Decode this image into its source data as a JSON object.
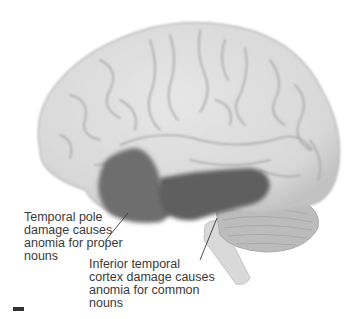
{
  "figure": {
    "type": "brain-lateral-view",
    "colors": {
      "cortex": "#dcdcdc",
      "cortex_shadow": "#b9b9b9",
      "sulcus": "#a8a8a8",
      "highlight_region": "#6e6e6e",
      "highlight_region_dark": "#5c5c5c",
      "cerebellum": "#bdbdbd",
      "brainstem": "#d6d6d6",
      "text": "#3a3a3a",
      "leader_line": "#3a3a3a"
    },
    "regions": [
      {
        "id": "temporal-pole",
        "name": "Temporal pole"
      },
      {
        "id": "inferior-temporal-cortex",
        "name": "Inferior temporal cortex"
      }
    ]
  },
  "annotations": {
    "temporal_pole": {
      "lines": [
        "Temporal pole",
        "damage causes",
        "anomia for proper",
        "nouns"
      ]
    },
    "inferior_temporal": {
      "lines": [
        "Inferior temporal",
        "cortex damage causes",
        "anomia for common",
        "nouns"
      ]
    }
  }
}
